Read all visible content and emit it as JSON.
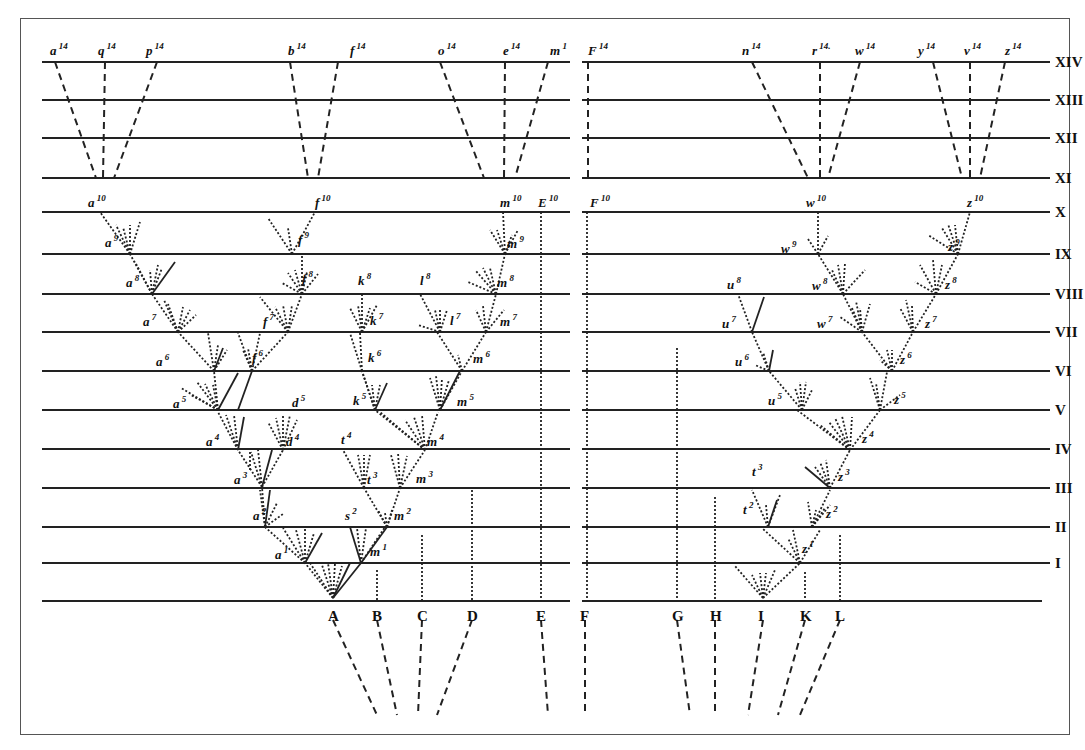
{
  "figure": {
    "title": "",
    "generations": [
      {
        "label": "XIV",
        "y": 62
      },
      {
        "label": "XIII",
        "y": 100
      },
      {
        "label": "XII",
        "y": 138
      },
      {
        "label": "XI",
        "y": 178
      },
      {
        "label": "X",
        "y": 212
      },
      {
        "label": "IX",
        "y": 254
      },
      {
        "label": "VIII",
        "y": 294
      },
      {
        "label": "VII",
        "y": 332
      },
      {
        "label": "VI",
        "y": 371
      },
      {
        "label": "V",
        "y": 410
      },
      {
        "label": "IV",
        "y": 449
      },
      {
        "label": "III",
        "y": 488
      },
      {
        "label": "II",
        "y": 527
      },
      {
        "label": "I",
        "y": 563
      }
    ],
    "base_y": 601,
    "ancestral_species": [
      {
        "label": "A",
        "x": 333
      },
      {
        "label": "B",
        "x": 377
      },
      {
        "label": "C",
        "x": 422
      },
      {
        "label": "D",
        "x": 472
      },
      {
        "label": "E",
        "x": 541
      },
      {
        "label": "F",
        "x": 585
      },
      {
        "label": "G",
        "x": 677
      },
      {
        "label": "H",
        "x": 715
      },
      {
        "label": "I",
        "x": 763
      },
      {
        "label": "K",
        "x": 805
      },
      {
        "label": "L",
        "x": 840
      }
    ],
    "top_labels": [
      {
        "base": "a",
        "sup": "14",
        "x": 50
      },
      {
        "base": "q",
        "sup": "14",
        "x": 98
      },
      {
        "base": "p",
        "sup": "14",
        "x": 146
      },
      {
        "base": "b",
        "sup": "14",
        "x": 288
      },
      {
        "base": "f",
        "sup": "14",
        "x": 350
      },
      {
        "base": "o",
        "sup": "14",
        "x": 438
      },
      {
        "base": "e",
        "sup": "14",
        "x": 503
      },
      {
        "base": "m",
        "sup": "1",
        "x": 550
      },
      {
        "base": "F",
        "sup": "14",
        "x": 588
      },
      {
        "base": "n",
        "sup": "14",
        "x": 742
      },
      {
        "base": "r",
        "sup": "14.",
        "x": 812
      },
      {
        "base": "w",
        "sup": "14",
        "x": 855
      },
      {
        "base": "y",
        "sup": "14",
        "x": 918
      },
      {
        "base": "v",
        "sup": "14",
        "x": 964
      },
      {
        "base": "z",
        "sup": "14",
        "x": 1005
      }
    ],
    "x_labels": [
      {
        "base": "a",
        "sup": "10",
        "x": 88
      },
      {
        "base": "f",
        "sup": "10",
        "x": 315
      },
      {
        "base": "m",
        "sup": "10",
        "x": 500
      },
      {
        "base": "E",
        "sup": "10",
        "x": 538
      },
      {
        "base": "F",
        "sup": "10",
        "x": 590
      },
      {
        "base": "w",
        "sup": "10",
        "x": 806
      },
      {
        "base": "z",
        "sup": "10",
        "x": 967
      }
    ],
    "inner_labels": [
      {
        "base": "a",
        "sup": "9",
        "x": 105,
        "y": 247
      },
      {
        "base": "f",
        "sup": "9",
        "x": 298,
        "y": 244
      },
      {
        "base": "m",
        "sup": "9",
        "x": 507,
        "y": 248
      },
      {
        "base": "a",
        "sup": "8",
        "x": 126,
        "y": 287
      },
      {
        "base": "f",
        "sup": "8",
        "x": 302,
        "y": 283
      },
      {
        "base": "k",
        "sup": "8",
        "x": 358,
        "y": 285
      },
      {
        "base": "l",
        "sup": "8",
        "x": 420,
        "y": 285
      },
      {
        "base": "m",
        "sup": "8",
        "x": 497,
        "y": 287
      },
      {
        "base": "a",
        "sup": "7",
        "x": 143,
        "y": 326
      },
      {
        "base": "f",
        "sup": "7",
        "x": 263,
        "y": 326
      },
      {
        "base": "k",
        "sup": "7",
        "x": 370,
        "y": 325
      },
      {
        "base": "l",
        "sup": "7",
        "x": 450,
        "y": 325
      },
      {
        "base": "m",
        "sup": "7",
        "x": 500,
        "y": 326
      },
      {
        "base": "a",
        "sup": "6",
        "x": 156,
        "y": 366
      },
      {
        "base": "f",
        "sup": "6",
        "x": 252,
        "y": 362
      },
      {
        "base": "k",
        "sup": "6",
        "x": 368,
        "y": 362
      },
      {
        "base": "m",
        "sup": "6",
        "x": 473,
        "y": 363
      },
      {
        "base": "a",
        "sup": "5",
        "x": 173,
        "y": 408
      },
      {
        "base": "d",
        "sup": "5",
        "x": 292,
        "y": 407
      },
      {
        "base": "k",
        "sup": "5",
        "x": 353,
        "y": 405
      },
      {
        "base": "m",
        "sup": "5",
        "x": 457,
        "y": 406
      },
      {
        "base": "a",
        "sup": "4",
        "x": 206,
        "y": 446
      },
      {
        "base": "d",
        "sup": "4",
        "x": 286,
        "y": 446
      },
      {
        "base": "t",
        "sup": "4",
        "x": 341,
        "y": 444
      },
      {
        "base": "m",
        "sup": "4",
        "x": 427,
        "y": 446
      },
      {
        "base": "a",
        "sup": "3",
        "x": 234,
        "y": 484
      },
      {
        "base": "t",
        "sup": "3",
        "x": 367,
        "y": 484
      },
      {
        "base": "m",
        "sup": "3",
        "x": 416,
        "y": 483
      },
      {
        "base": "a",
        "sup": "2",
        "x": 253,
        "y": 520
      },
      {
        "base": "s",
        "sup": "2",
        "x": 345,
        "y": 520
      },
      {
        "base": "m",
        "sup": "2",
        "x": 394,
        "y": 520
      },
      {
        "base": "a",
        "sup": "1",
        "x": 275,
        "y": 559
      },
      {
        "base": "m",
        "sup": "1",
        "x": 370,
        "y": 556
      },
      {
        "base": "w",
        "sup": "9",
        "x": 781,
        "y": 253
      },
      {
        "base": "z",
        "sup": "9",
        "x": 948,
        "y": 251
      },
      {
        "base": "u",
        "sup": "8",
        "x": 727,
        "y": 289
      },
      {
        "base": "w",
        "sup": "8",
        "x": 812,
        "y": 290
      },
      {
        "base": "z",
        "sup": "8",
        "x": 945,
        "y": 289
      },
      {
        "base": "u",
        "sup": "7",
        "x": 722,
        "y": 328
      },
      {
        "base": "w",
        "sup": "7",
        "x": 817,
        "y": 328
      },
      {
        "base": "z",
        "sup": "7",
        "x": 925,
        "y": 328
      },
      {
        "base": "u",
        "sup": "6",
        "x": 735,
        "y": 366
      },
      {
        "base": "z",
        "sup": "6",
        "x": 900,
        "y": 364
      },
      {
        "base": "u",
        "sup": "5",
        "x": 768,
        "y": 405
      },
      {
        "base": "z",
        "sup": "5",
        "x": 894,
        "y": 404
      },
      {
        "base": "z",
        "sup": "4",
        "x": 862,
        "y": 443
      },
      {
        "base": "t",
        "sup": "3",
        "x": 752,
        "y": 476
      },
      {
        "base": "z",
        "sup": "3",
        "x": 838,
        "y": 481
      },
      {
        "base": "t",
        "sup": "2",
        "x": 743,
        "y": 514
      },
      {
        "base": "z",
        "sup": "2",
        "x": 826,
        "y": 518
      },
      {
        "base": "z",
        "sup": "1",
        "x": 802,
        "y": 553
      }
    ]
  }
}
